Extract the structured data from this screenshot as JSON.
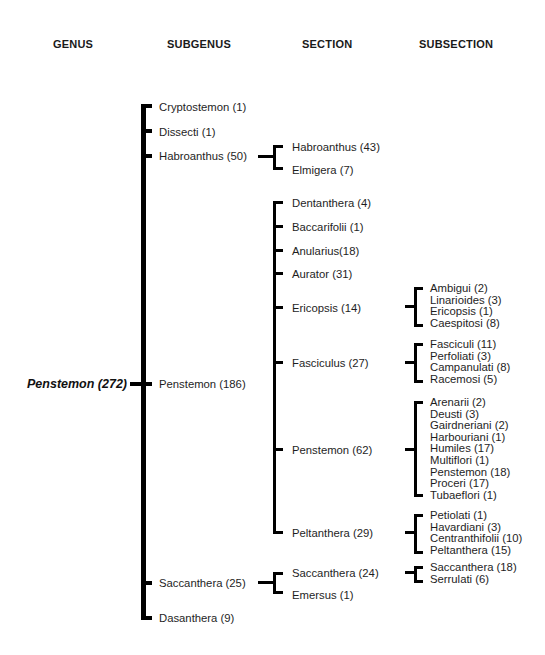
{
  "headers": {
    "genus": "GENUS",
    "subgenus": "SUBGENUS",
    "section": "SECTION",
    "subsection": "SUBSECTION"
  },
  "genus": {
    "label": "Penstemon (272)"
  },
  "subgenera": [
    {
      "label": "Cryptostemon (1)"
    },
    {
      "label": "Dissecti (1)"
    },
    {
      "label": "Habroanthus (50)"
    },
    {
      "label": "Penstemon (186)"
    },
    {
      "label": "Saccanthera (25)"
    },
    {
      "label": "Dasanthera (9)"
    }
  ],
  "sections": {
    "habroanthus": [
      {
        "label": "Habroanthus (43)"
      },
      {
        "label": "Elmigera (7)"
      }
    ],
    "penstemon": [
      {
        "label": "Dentanthera (4)"
      },
      {
        "label": "Baccarifolii (1)"
      },
      {
        "label": "Anularius(18)"
      },
      {
        "label": "Aurator (31)"
      },
      {
        "label": "Ericopsis (14)"
      },
      {
        "label": "Fasciculus (27)"
      },
      {
        "label": "Penstemon (62)"
      },
      {
        "label": "Peltanthera (29)"
      }
    ],
    "saccanthera": [
      {
        "label": "Saccanthera (24)"
      },
      {
        "label": "Emersus (1)"
      }
    ]
  },
  "subsections": {
    "ericopsis": [
      "Ambigui (2)",
      "Linarioides (3)",
      "Ericopsis (1)",
      "Caespitosi (8)"
    ],
    "fasciculus": [
      "Fasciculi (11)",
      "Perfoliati (3)",
      "Campanulati (8)",
      "Racemosi (5)"
    ],
    "penstemon": [
      "Arenarii (2)",
      "Deusti (3)",
      "Gairdneriani (2)",
      "Harbouriani (1)",
      "Humiles (17)",
      "Multiflori (1)",
      "Penstemon (18)",
      "Proceri (17)",
      "Tubaeflori (1)"
    ],
    "peltanthera": [
      "Petiolati (1)",
      "Havardiani (3)",
      "Centranthifolii (10)",
      "Peltanthera (15)"
    ],
    "saccanthera": [
      "Saccanthera (18)",
      "Serrulati (6)"
    ]
  }
}
